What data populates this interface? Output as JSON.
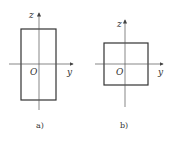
{
  "figures": [
    {
      "id": "a",
      "caption": "a)",
      "shape": "rectangle",
      "axis_labels": {
        "vertical": "z",
        "horizontal": "y",
        "origin": "O"
      }
    },
    {
      "id": "b",
      "caption": "b)",
      "shape": "square",
      "axis_labels": {
        "vertical": "z",
        "horizontal": "y",
        "origin": "O"
      }
    }
  ],
  "colors": {
    "stroke": "#333333",
    "axis": "#555555",
    "background": "#ffffff"
  }
}
